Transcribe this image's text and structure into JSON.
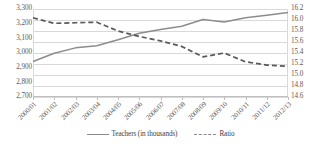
{
  "chart_data": {
    "type": "line",
    "title": "",
    "subtitle": "",
    "xlabel": "",
    "ylabel": "",
    "y2label": "",
    "grid": true,
    "legend_position": "bottom",
    "categories": [
      "2000/01",
      "2001/02",
      "2002/03",
      "2003/04",
      "2004/05",
      "2005/06",
      "2006/07",
      "2007/08",
      "2008/09",
      "2009/10",
      "2010/11",
      "2011/12",
      "2012/13"
    ],
    "ylim": [
      2700,
      3300
    ],
    "yticks": [
      "2,700",
      "2,800",
      "2,900",
      "3,000",
      "3,100",
      "3,200",
      "3,300"
    ],
    "ytick_values": [
      2700,
      2800,
      2900,
      3000,
      3100,
      3200,
      3300
    ],
    "y2lim": [
      14.6,
      16.2
    ],
    "y2ticks": [
      "14.6",
      "14.8",
      "15.0",
      "15.2",
      "15.4",
      "15.6",
      "15.8",
      "16.0",
      "16.2"
    ],
    "y2tick_values": [
      14.6,
      14.8,
      15.0,
      15.2,
      15.4,
      15.6,
      15.8,
      16.0,
      16.2
    ],
    "series": [
      {
        "name": "Teachers (in thousands)",
        "axis": "left",
        "style": "solid",
        "color": "#8c8c8c",
        "values": [
          2942,
          2998,
          3035,
          3050,
          3090,
          3135,
          3160,
          3182,
          3228,
          3212,
          3240,
          3258,
          3276
        ]
      },
      {
        "name": "Ratio",
        "axis": "right",
        "style": "dashed",
        "color": "#595959",
        "values": [
          16.04,
          15.94,
          15.95,
          15.96,
          15.8,
          15.7,
          15.62,
          15.52,
          15.33,
          15.4,
          15.24,
          15.18,
          15.16
        ]
      }
    ]
  },
  "legend": {
    "items": [
      {
        "label": "Teachers (in thousands)",
        "style": "solid"
      },
      {
        "label": "Ratio",
        "style": "dashed"
      }
    ]
  }
}
